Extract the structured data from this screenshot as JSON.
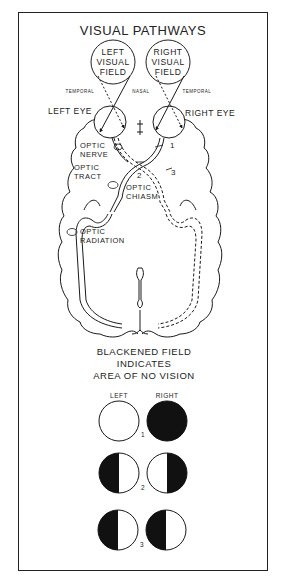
{
  "title": "VISUAL PATHWAYS",
  "fields": {
    "left": [
      "LEFT",
      "VISUAL",
      "FIELD"
    ],
    "right": [
      "RIGHT",
      "VISUAL",
      "FIELD"
    ]
  },
  "side_labels": {
    "temporal_left": "TEMPORAL",
    "nasal": "NASAL",
    "temporal_right": "TEMPORAL"
  },
  "eyes": {
    "left": "LEFT EYE",
    "right": "RIGHT EYE"
  },
  "structures": {
    "optic_nerve": [
      "OPTIC",
      "NERVE"
    ],
    "optic_tract": [
      "OPTIC",
      "TRACT"
    ],
    "optic_chiasm": [
      "OPTIC",
      "CHIASM"
    ],
    "optic_radiation": [
      "OPTIC",
      "RADIATION"
    ]
  },
  "lesion_markers": [
    "1",
    "2",
    "3"
  ],
  "legend": {
    "caption": [
      "BLACKENED FIELD",
      "INDICATES",
      "AREA OF NO VISION"
    ],
    "col_left": "LEFT",
    "col_right": "RIGHT",
    "rows": [
      {
        "number": "1",
        "left": "full-vision",
        "right": "blind"
      },
      {
        "number": "2",
        "left": "left-half-blind",
        "right": "right-half-blind"
      },
      {
        "number": "3",
        "left": "left-half-blind",
        "right": "left-half-blind"
      }
    ]
  },
  "colors": {
    "ink": "#1a1a1a",
    "paper": "#ffffff"
  }
}
